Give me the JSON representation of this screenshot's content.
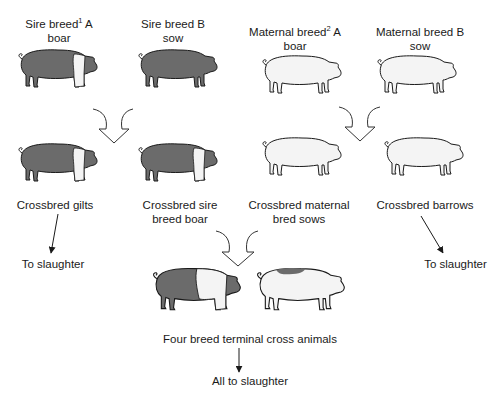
{
  "diagram": {
    "type": "four-breed terminal crossbreeding scheme",
    "colors": {
      "dark_pig": "#6b6b6b",
      "light_pig": "#f4f4f4",
      "outline": "#1a1a1a",
      "arrow": "#333333"
    },
    "parents": [
      {
        "id": "sire-a",
        "line1": "Sire breed",
        "sup": "1",
        "line1_after": " A",
        "line2": "boar",
        "pattern": "dark-belted"
      },
      {
        "id": "sire-b",
        "line1": "Sire breed B",
        "line2": "sow",
        "pattern": "dark"
      },
      {
        "id": "maternal-a",
        "line1": "Maternal breed",
        "sup": "2",
        "line1_after": " A",
        "line2": "boar",
        "pattern": "light"
      },
      {
        "id": "maternal-b",
        "line1": "Maternal breed B",
        "line2": "sow",
        "pattern": "light"
      }
    ],
    "crosses": [
      {
        "id": "crossbred-gilts",
        "line1": "Crossbred gilts",
        "line2": "",
        "pattern": "dark-belted"
      },
      {
        "id": "crossbred-sire-boar",
        "line1": "Crossbred sire",
        "line2": "breed boar",
        "pattern": "dark-belted"
      },
      {
        "id": "crossbred-maternal-sows",
        "line1": "Crossbred maternal",
        "line2": "bred sows",
        "pattern": "light"
      },
      {
        "id": "crossbred-barrows",
        "line1": "Crossbred barrows",
        "line2": "",
        "pattern": "light"
      }
    ],
    "outcomes": {
      "left": "To slaughter",
      "right": "To slaughter",
      "terminal_label": "Four breed terminal cross animals",
      "final": "All to slaughter"
    },
    "terminal_pigs": [
      {
        "id": "terminal-1",
        "pattern": "dark-belted-front"
      },
      {
        "id": "terminal-2",
        "pattern": "light-spotted"
      }
    ]
  }
}
